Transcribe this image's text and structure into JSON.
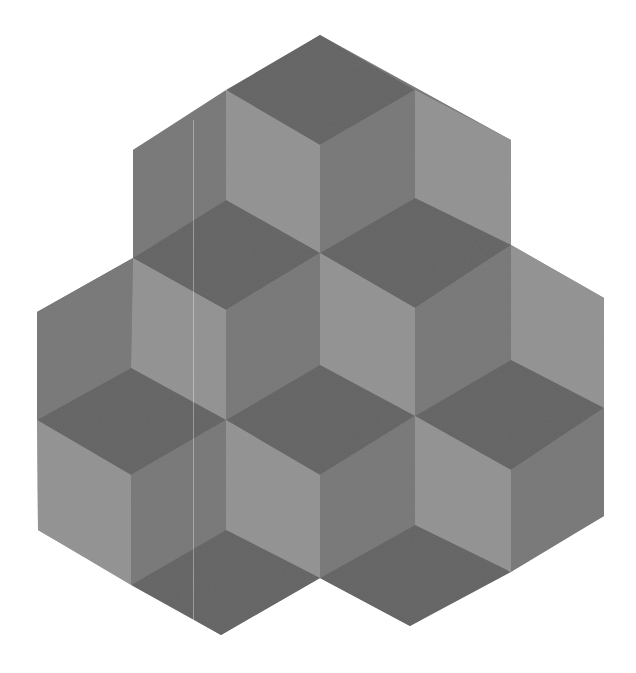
{
  "figure": {
    "width": 636,
    "height": 673,
    "background": "#ffffff",
    "colors": {
      "dark_top": "#666666",
      "medium_right": "#7a7a7a",
      "light_left": "#939393"
    },
    "silhouette": [
      [
        320,
        35
      ],
      [
        511,
        140
      ],
      [
        511,
        245
      ],
      [
        604,
        298
      ],
      [
        604,
        516
      ],
      [
        410,
        626
      ],
      [
        320,
        578
      ],
      [
        221,
        635
      ],
      [
        38,
        530
      ],
      [
        37,
        312
      ],
      [
        133,
        258
      ],
      [
        133,
        150
      ]
    ],
    "faces": [
      {
        "shade": "dark_top",
        "points": [
          [
            320,
            35
          ],
          [
            415,
            90
          ],
          [
            320,
            145
          ],
          [
            226,
            90
          ]
        ]
      },
      {
        "shade": "light_left",
        "points": [
          [
            226,
            90
          ],
          [
            320,
            145
          ],
          [
            320,
            253
          ],
          [
            226,
            200
          ]
        ]
      },
      {
        "shade": "medium_right",
        "points": [
          [
            320,
            145
          ],
          [
            415,
            90
          ],
          [
            415,
            198
          ],
          [
            320,
            253
          ]
        ]
      },
      {
        "shade": "medium_right",
        "points": [
          [
            133,
            150
          ],
          [
            226,
            90
          ],
          [
            226,
            200
          ],
          [
            133,
            258
          ]
        ]
      },
      {
        "shade": "light_left",
        "points": [
          [
            415,
            90
          ],
          [
            511,
            140
          ],
          [
            511,
            245
          ],
          [
            415,
            198
          ]
        ]
      },
      {
        "shade": "dark_top",
        "points": [
          [
            133,
            258
          ],
          [
            226,
            200
          ],
          [
            320,
            253
          ],
          [
            226,
            310
          ]
        ]
      },
      {
        "shade": "light_left",
        "points": [
          [
            133,
            258
          ],
          [
            226,
            310
          ],
          [
            226,
            420
          ],
          [
            131,
            368
          ]
        ]
      },
      {
        "shade": "medium_right",
        "points": [
          [
            226,
            310
          ],
          [
            320,
            253
          ],
          [
            320,
            365
          ],
          [
            226,
            420
          ]
        ]
      },
      {
        "shade": "dark_top",
        "points": [
          [
            320,
            253
          ],
          [
            415,
            198
          ],
          [
            511,
            245
          ],
          [
            415,
            308
          ]
        ]
      },
      {
        "shade": "light_left",
        "points": [
          [
            320,
            253
          ],
          [
            415,
            308
          ],
          [
            415,
            416
          ],
          [
            320,
            365
          ]
        ]
      },
      {
        "shade": "medium_right",
        "points": [
          [
            415,
            308
          ],
          [
            511,
            245
          ],
          [
            511,
            360
          ],
          [
            415,
            416
          ]
        ]
      },
      {
        "shade": "light_left",
        "points": [
          [
            511,
            245
          ],
          [
            604,
            298
          ],
          [
            604,
            408
          ],
          [
            511,
            360
          ]
        ]
      },
      {
        "shade": "medium_right",
        "points": [
          [
            37,
            312
          ],
          [
            133,
            258
          ],
          [
            131,
            368
          ],
          [
            37,
            420
          ]
        ]
      },
      {
        "shade": "dark_top",
        "points": [
          [
            37,
            420
          ],
          [
            131,
            368
          ],
          [
            226,
            420
          ],
          [
            131,
            475
          ]
        ]
      },
      {
        "shade": "light_left",
        "points": [
          [
            37,
            420
          ],
          [
            131,
            475
          ],
          [
            131,
            585
          ],
          [
            38,
            530
          ]
        ]
      },
      {
        "shade": "medium_right",
        "points": [
          [
            131,
            475
          ],
          [
            226,
            420
          ],
          [
            226,
            530
          ],
          [
            131,
            585
          ]
        ]
      },
      {
        "shade": "dark_top",
        "points": [
          [
            226,
            420
          ],
          [
            320,
            365
          ],
          [
            415,
            416
          ],
          [
            320,
            475
          ]
        ]
      },
      {
        "shade": "light_left",
        "points": [
          [
            226,
            420
          ],
          [
            320,
            475
          ],
          [
            320,
            578
          ],
          [
            226,
            530
          ]
        ]
      },
      {
        "shade": "medium_right",
        "points": [
          [
            320,
            475
          ],
          [
            415,
            416
          ],
          [
            415,
            525
          ],
          [
            320,
            578
          ]
        ]
      },
      {
        "shade": "dark_top",
        "points": [
          [
            415,
            416
          ],
          [
            511,
            360
          ],
          [
            604,
            408
          ],
          [
            511,
            470
          ]
        ]
      },
      {
        "shade": "light_left",
        "points": [
          [
            415,
            416
          ],
          [
            511,
            470
          ],
          [
            511,
            572
          ],
          [
            415,
            525
          ]
        ]
      },
      {
        "shade": "medium_right",
        "points": [
          [
            511,
            470
          ],
          [
            604,
            408
          ],
          [
            604,
            516
          ],
          [
            511,
            572
          ]
        ]
      },
      {
        "shade": "dark_top",
        "points": [
          [
            131,
            585
          ],
          [
            226,
            530
          ],
          [
            320,
            578
          ],
          [
            221,
            635
          ]
        ]
      },
      {
        "shade": "dark_top",
        "points": [
          [
            320,
            578
          ],
          [
            415,
            525
          ],
          [
            511,
            572
          ],
          [
            410,
            626
          ]
        ]
      }
    ]
  }
}
